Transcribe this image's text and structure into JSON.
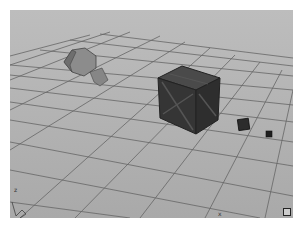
{
  "viewport": {
    "label": "3D perspective viewport",
    "background": "#b4b4b4",
    "grid_color": "#6e6e6e",
    "axis_labels": {
      "left": "z",
      "bottom": "x"
    },
    "objects": [
      {
        "name": "hexagonal-mesh",
        "color": "#8a8a8a"
      },
      {
        "name": "wooden-crate-large",
        "color": "#3c3c3c"
      },
      {
        "name": "crate-small",
        "color": "#2a2a2a"
      },
      {
        "name": "crate-tiny",
        "color": "#1e1e1e"
      }
    ]
  }
}
